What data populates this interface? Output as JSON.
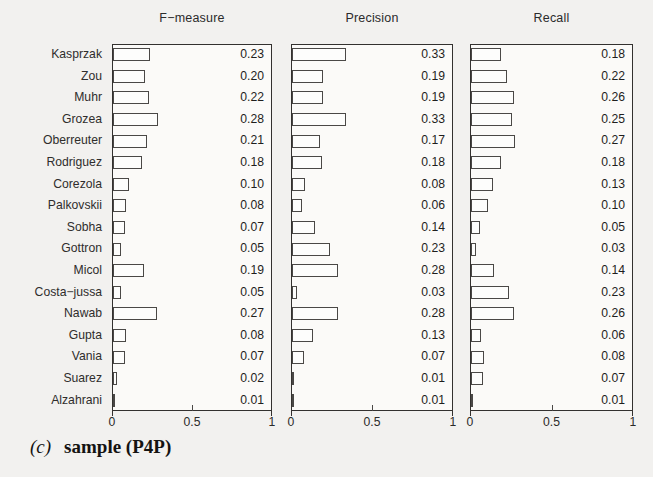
{
  "caption": {
    "index": "(c)",
    "text": "sample (P4P)"
  },
  "axis": {
    "ticks": [
      "0",
      "0.5",
      "1"
    ],
    "tick_values": [
      0,
      0.5,
      1
    ],
    "xlim": [
      0,
      1
    ]
  },
  "colors": {
    "background": "#f2f1ef",
    "panel_background": "#fbfaf8",
    "axis": "#33312f",
    "bar_fill": "#fdfdfc",
    "bar_edge": "#4a4846",
    "text": "#2b2a29"
  },
  "chart_data": {
    "type": "bar",
    "xlabel": "",
    "ylabel": "",
    "xlim": [
      0,
      1
    ],
    "grid": false,
    "legend": "none",
    "orientation": "horizontal",
    "panels": [
      "F−measure",
      "Precision",
      "Recall"
    ],
    "categories": [
      "Kasprzak",
      "Zou",
      "Muhr",
      "Grozea",
      "Oberreuter",
      "Rodriguez",
      "Corezola",
      "Palkovskii",
      "Sobha",
      "Gottron",
      "Micol",
      "Costa−jussa",
      "Nawab",
      "Gupta",
      "Vania",
      "Suarez",
      "Alzahrani"
    ],
    "series": [
      {
        "name": "F−measure",
        "values": [
          0.23,
          0.2,
          0.22,
          0.28,
          0.21,
          0.18,
          0.1,
          0.08,
          0.07,
          0.05,
          0.19,
          0.05,
          0.27,
          0.08,
          0.07,
          0.02,
          0.01
        ],
        "labels": [
          "0.23",
          "0.20",
          "0.22",
          "0.28",
          "0.21",
          "0.18",
          "0.10",
          "0.08",
          "0.07",
          "0.05",
          "0.19",
          "0.05",
          "0.27",
          "0.08",
          "0.07",
          "0.02",
          "0.01"
        ]
      },
      {
        "name": "Precision",
        "values": [
          0.33,
          0.19,
          0.19,
          0.33,
          0.17,
          0.18,
          0.08,
          0.06,
          0.14,
          0.23,
          0.28,
          0.03,
          0.28,
          0.13,
          0.07,
          0.01,
          0.01
        ],
        "labels": [
          "0.33",
          "0.19",
          "0.19",
          "0.33",
          "0.17",
          "0.18",
          "0.08",
          "0.06",
          "0.14",
          "0.23",
          "0.28",
          "0.03",
          "0.28",
          "0.13",
          "0.07",
          "0.01",
          "0.01"
        ]
      },
      {
        "name": "Recall",
        "values": [
          0.18,
          0.22,
          0.26,
          0.25,
          0.27,
          0.18,
          0.13,
          0.1,
          0.05,
          0.03,
          0.14,
          0.23,
          0.26,
          0.06,
          0.08,
          0.07,
          0.01
        ],
        "labels": [
          "0.18",
          "0.22",
          "0.26",
          "0.25",
          "0.27",
          "0.18",
          "0.13",
          "0.10",
          "0.05",
          "0.03",
          "0.14",
          "0.23",
          "0.26",
          "0.06",
          "0.08",
          "0.07",
          "0.01"
        ]
      }
    ]
  }
}
